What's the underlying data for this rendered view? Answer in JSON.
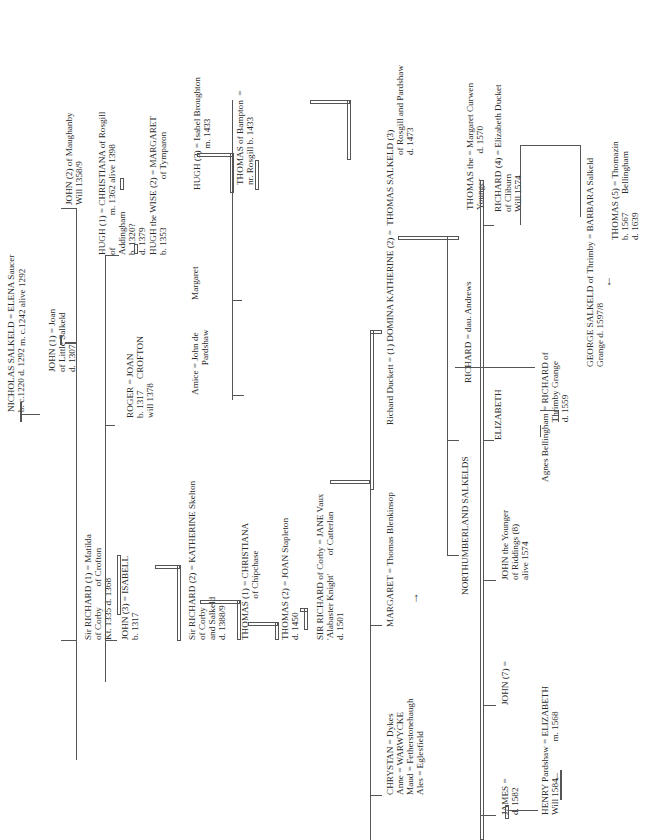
{
  "people": [
    {
      "id": "nicholas",
      "lines": [
        "NICHOLAS SALKELD = ELENA Saucer",
        "b. c.1220 d. 1292"
      ],
      "pos": [
        6,
        412
      ]
    },
    {
      "id": "elena_m",
      "lines": [
        "m. c.1242 alive 1292"
      ],
      "pos": [
        17,
        346
      ]
    },
    {
      "id": "john1",
      "lines": [
        "JOHN (1) = Joan",
        "of Little Salkeld",
        "d. 1307"
      ],
      "pos": [
        47,
        372
      ]
    },
    {
      "id": "john2",
      "lines": [
        "JOHN (2) of Maughanby",
        "Will 1358/9"
      ],
      "pos": [
        64,
        205
      ]
    },
    {
      "id": "sir_richard1",
      "lines": [
        "Sir RICHARD (1) = Matilda",
        "of Corby         of Crofton",
        "Kt. 1335 d. 1368"
      ],
      "pos": [
        83,
        640
      ]
    },
    {
      "id": "john3",
      "lines": [
        "JOHN (3) = ISABELL",
        "b. 1317"
      ],
      "pos": [
        120,
        640
      ]
    },
    {
      "id": "roger",
      "lines": [
        "ROGER = JOAN",
        "b. 1317     CROFTON",
        "will 1378"
      ],
      "pos": [
        125,
        418
      ]
    },
    {
      "id": "hugh1",
      "lines": [
        "HUGH (1) = CHRISTIANA of Rosgill",
        "of              m. 1362 alive 1398",
        "Addingham",
        "b. 1320?",
        "d. 1379"
      ],
      "pos": [
        97,
        255
      ]
    },
    {
      "id": "sir_richard2",
      "lines": [
        "Sir RICHARD (2) = KATHERINE Skelton",
        "of Corby",
        "and Salkeld",
        "d. 1388/9"
      ],
      "pos": [
        187,
        640
      ]
    },
    {
      "id": "hugh_wise",
      "lines": [
        "HUGH the WISE (2) = MARGARET",
        "b. 1353                     of Tymparon"
      ],
      "pos": [
        148,
        255
      ]
    },
    {
      "id": "thomas1",
      "lines": [
        "THOMAS (1) = CHRISTIANA",
        "                  of Chipchase"
      ],
      "pos": [
        240,
        640
      ]
    },
    {
      "id": "amice",
      "lines": [
        "Amice = John de",
        "             Pardshaw"
      ],
      "pos": [
        190,
        395
      ]
    },
    {
      "id": "margaret_hugh",
      "lines": [
        "Margaret"
      ],
      "pos": [
        190,
        300
      ]
    },
    {
      "id": "hugh3",
      "lines": [
        "HUGH (3) = Isabel Broughton",
        "                  m. 1433"
      ],
      "pos": [
        192,
        190
      ]
    },
    {
      "id": "thomas2",
      "lines": [
        "THOMAS (2) = JOAN Stapleton",
        "d. 1450"
      ],
      "pos": [
        280,
        640
      ]
    },
    {
      "id": "thomas_bampton",
      "lines": [
        "THOMAS of Bampton  =",
        "nr. Rosgill b. 1433"
      ],
      "pos": [
        235,
        185
      ]
    },
    {
      "id": "sir_richard_corby",
      "lines": [
        "SIR RICHARD of Corby = JANE Vaux",
        "'Alabaster Knight'        of Catterlan",
        "d. 1501"
      ],
      "pos": [
        315,
        640
      ]
    },
    {
      "id": "margaret_blenkinsop",
      "lines": [
        "MARGARET = Thomas Blenkinsop"
      ],
      "pos": [
        385,
        627
      ]
    },
    {
      "id": "richard_duckett",
      "lines": [
        "Richard Duckett = (1) DOMINA KATHERINE (2) =  THOMAS SALKELD (3)"
      ],
      "pos": [
        385,
        425
      ]
    },
    {
      "id": "thomas_salkeld3_sub",
      "lines": [
        "of Rosgill and Pardshaw",
        "d. 1473"
      ],
      "pos": [
        395,
        155
      ]
    },
    {
      "id": "chrystan",
      "lines": [
        "CHRYSTAN = Dykes",
        "Anne = WARWYCKE",
        "Maud = Fetherstonehaugh",
        "Ales = Eglesfield"
      ],
      "pos": [
        385,
        795
      ]
    },
    {
      "id": "northumberland",
      "lines": [
        "NORTHUMBERLAND SALKELDS"
      ],
      "pos": [
        460,
        595
      ]
    },
    {
      "id": "thomas_younger",
      "lines": [
        "THOMAS the = Margaret Curwen",
        "Younger           d. 1570"
      ],
      "pos": [
        465,
        210
      ]
    },
    {
      "id": "richard_andrews",
      "lines": [
        "RICHARD = dau. Andrews"
      ],
      "pos": [
        463,
        383
      ]
    },
    {
      "id": "richard4",
      "lines": [
        "RICHARD (4) = Elizabeth Ducket",
        "of Cliburn",
        "Will 1574"
      ],
      "pos": [
        493,
        212
      ]
    },
    {
      "id": "elizabeth",
      "lines": [
        "ELIZABETH"
      ],
      "pos": [
        493,
        440
      ]
    },
    {
      "id": "agnes",
      "lines": [
        "Agnes Bellingham = RICHARD of",
        "                          Thrimby Grange",
        "                          d. 1559"
      ],
      "pos": [
        540,
        482
      ]
    },
    {
      "id": "george",
      "lines": [
        "GEORGE SALKELD of Thrimby = BARBARA Salkeld",
        "Grange d. 1597/8"
      ],
      "pos": [
        585,
        367
      ]
    },
    {
      "id": "thomas5",
      "lines": [
        "THOMAS (5) = Thomazin",
        "b. 1567        Bellingham",
        "d. 1639"
      ],
      "pos": [
        610,
        240
      ]
    },
    {
      "id": "john_younger",
      "lines": [
        "JOHN the Younger",
        "of Riddings (8)",
        "alive 1574"
      ],
      "pos": [
        500,
        580
      ]
    },
    {
      "id": "john7",
      "lines": [
        "JOHN (7) ="
      ],
      "pos": [
        500,
        705
      ]
    },
    {
      "id": "james",
      "lines": [
        "JAMES =",
        "d. 1582"
      ],
      "pos": [
        500,
        815
      ]
    },
    {
      "id": "henry",
      "lines": [
        "HENRY Pardshaw = ELIZABETH",
        "Will 1584                m. 1568"
      ],
      "pos": [
        540,
        815
      ]
    }
  ]
}
